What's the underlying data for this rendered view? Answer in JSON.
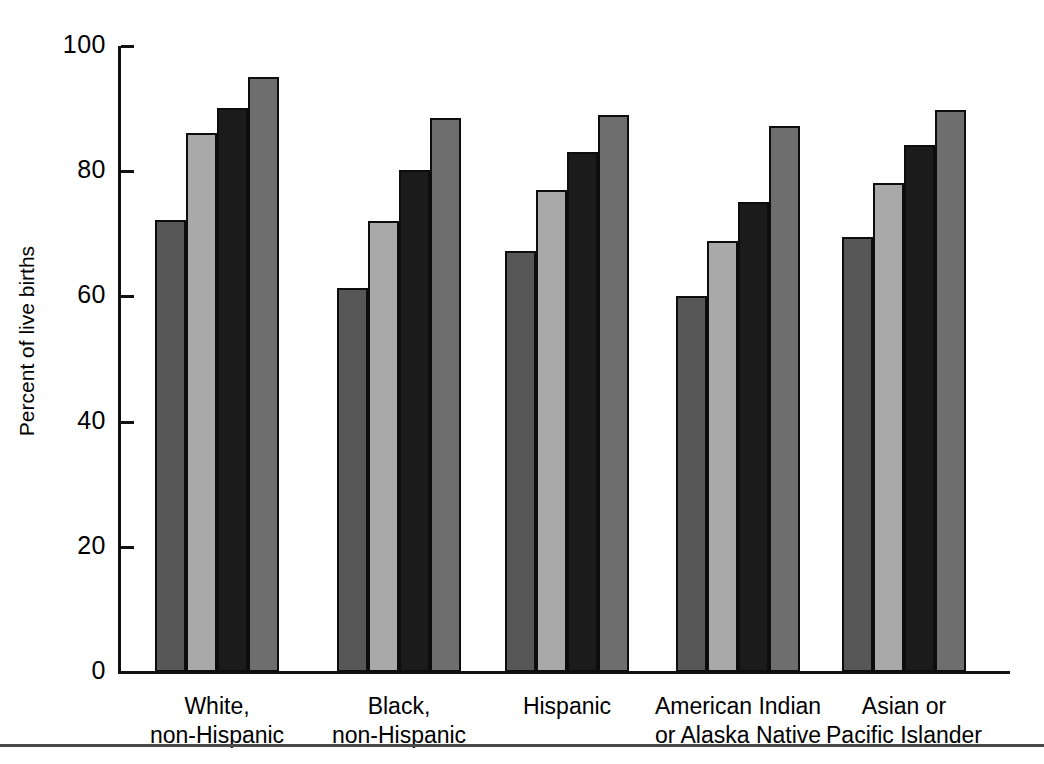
{
  "chart_data": {
    "type": "bar",
    "title": "",
    "subtitle": "",
    "xlabel": "",
    "ylabel": "Percent of live births",
    "ylim": [
      0,
      100
    ],
    "yticks": [
      0,
      20,
      40,
      60,
      80,
      100
    ],
    "ytick_labels": [
      "0",
      "20",
      "40",
      "60",
      "80",
      "100"
    ],
    "grid": false,
    "legend": "none",
    "legend_entries": [],
    "categories": [
      "White,\nnon-Hispanic",
      "Black,\nnon-Hispanic",
      "Hispanic",
      "American Indian\nor Alaska Native",
      "Asian or\nPacific Islander"
    ],
    "series": [
      {
        "name": "series-1",
        "color": "#575757",
        "values": [
          72.2,
          61.4,
          67.2,
          60.1,
          69.5
        ]
      },
      {
        "name": "series-2",
        "color": "#a9a9a9",
        "values": [
          86.1,
          72.0,
          77.0,
          68.8,
          78.1
        ]
      },
      {
        "name": "series-3",
        "color": "#1b1b1b",
        "values": [
          90.1,
          80.2,
          83.1,
          75.1,
          84.2
        ]
      },
      {
        "name": "series-4",
        "color": "#6e6e6e",
        "values": [
          95.0,
          88.5,
          88.9,
          87.3,
          89.7
        ]
      }
    ]
  },
  "axis": {
    "y_title": "Percent of live births"
  },
  "colors": {
    "series_1": "#575757",
    "series_2": "#a9a9a9",
    "series_3": "#1b1b1b",
    "series_4": "#6e6e6e",
    "axis": "#111111",
    "rule": "#4a4a4a",
    "background": "#ffffff"
  }
}
